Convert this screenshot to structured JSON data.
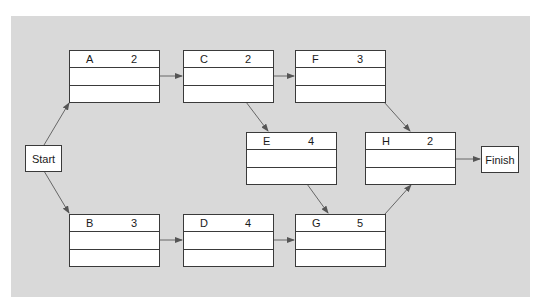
{
  "diagram": {
    "type": "activity-on-node network",
    "background_color": "#d9d9d9",
    "terminals": {
      "start": "Start",
      "finish": "Finish"
    },
    "activities": [
      {
        "id": "A",
        "duration": "2"
      },
      {
        "id": "B",
        "duration": "3"
      },
      {
        "id": "C",
        "duration": "2"
      },
      {
        "id": "D",
        "duration": "4"
      },
      {
        "id": "E",
        "duration": "4"
      },
      {
        "id": "F",
        "duration": "3"
      },
      {
        "id": "G",
        "duration": "5"
      },
      {
        "id": "H",
        "duration": "2"
      }
    ],
    "edges": [
      [
        "Start",
        "A"
      ],
      [
        "Start",
        "B"
      ],
      [
        "A",
        "C"
      ],
      [
        "B",
        "D"
      ],
      [
        "C",
        "F"
      ],
      [
        "C",
        "E"
      ],
      [
        "D",
        "G"
      ],
      [
        "E",
        "G"
      ],
      [
        "F",
        "H"
      ],
      [
        "G",
        "H"
      ],
      [
        "H",
        "Finish"
      ]
    ]
  }
}
